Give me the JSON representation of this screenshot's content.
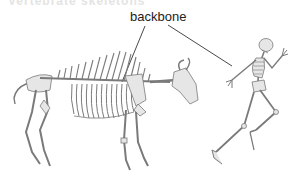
{
  "diagram": {
    "title_fragment": "Vertebrate skeletons",
    "label": "backbone",
    "figures": [
      {
        "name": "bison-skeleton",
        "description": "Quadruped (bison) skeleton, side view"
      },
      {
        "name": "human-skeleton",
        "description": "Running human skeleton"
      }
    ],
    "colors": {
      "bone_fill": "#e6e6e6",
      "bone_stroke": "#7a7a7a",
      "leader_line": "#333333",
      "text": "#222222"
    }
  }
}
